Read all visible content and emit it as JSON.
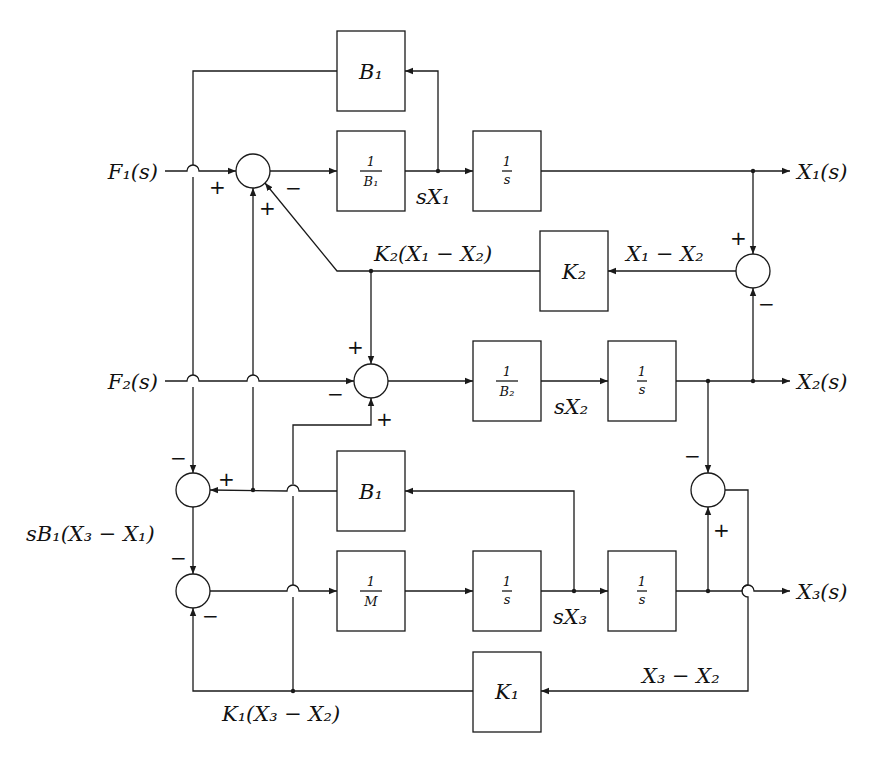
{
  "diagram": {
    "title": "",
    "inputs": {
      "f1": "F₁(s)",
      "f2": "F₂(s)"
    },
    "outputs": {
      "x1": "X₁(s)",
      "x2": "X₂(s)",
      "x3": "X₃(s)"
    },
    "blocks": {
      "b1_top": "B₁",
      "inv_b1_num": "1",
      "inv_b1_den": "B₁",
      "int1_num": "1",
      "int1_den": "s",
      "k2": "K₂",
      "inv_b2_num": "1",
      "inv_b2_den": "B₂",
      "int2_num": "1",
      "int2_den": "s",
      "b1_low": "B₁",
      "inv_m_num": "1",
      "inv_m_den": "M",
      "int3a_num": "1",
      "int3a_den": "s",
      "int3b_num": "1",
      "int3b_den": "s",
      "k1": "K₁"
    },
    "signals": {
      "sx1": "sX₁",
      "k2_term": "K₂(X₁ − X₂)",
      "x1_minus_x2": "X₁ − X₂",
      "sx2": "sX₂",
      "sb1_term": "sB₁(X₃ − X₁)",
      "sx3": "sX₃",
      "x3_minus_x2": "X₃ − X₂",
      "k1_term": "K₁(X₃ − X₂)"
    },
    "signs": {
      "sum1_left": "+",
      "sum1_bottom": "+",
      "sum1_diag": "−",
      "sumr1_top": "+",
      "sumr1_bottom": "−",
      "sum2_top": "+",
      "sum2_left": "−",
      "sum2_bottom": "+",
      "suml_top": "−",
      "suml_right": "+",
      "sumr2_top": "−",
      "sumr2_bottom": "+",
      "sumb_top": "−",
      "sumb_bottom": "−"
    }
  }
}
